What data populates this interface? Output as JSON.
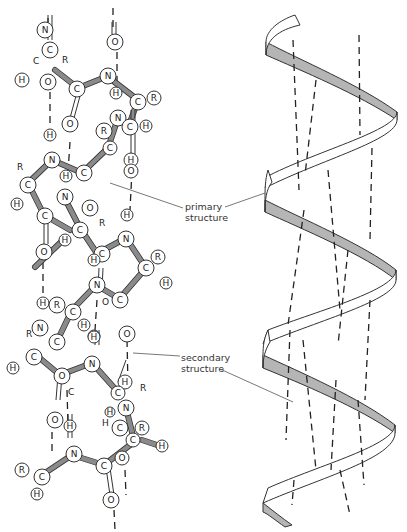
{
  "figure": {
    "left_panel": "ball-and-stick model of alpha helix",
    "right_panel": "ribbon model of alpha helix"
  },
  "labels": {
    "primary": [
      "primary",
      "structure"
    ],
    "secondary": [
      "secondary",
      "structure"
    ]
  },
  "atoms": {
    "N": "N",
    "C": "C",
    "O": "O",
    "H": "H",
    "R": "R"
  }
}
